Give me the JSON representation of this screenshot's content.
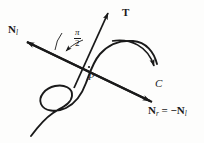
{
  "figure": {
    "kind": "math-diagram",
    "caption_absent": true,
    "background_color": "#fdfdfc",
    "ink_color": "#1a1a1a"
  },
  "labels": {
    "normal_left": {
      "symbol": "N",
      "subscript": "l"
    },
    "tangent": {
      "symbol": "T"
    },
    "curve": {
      "symbol": "C"
    },
    "point": {
      "symbol": "P"
    },
    "angle": {
      "numerator": "π",
      "denominator": "2"
    },
    "equation": {
      "lhs_symbol": "N",
      "lhs_subscript": "r",
      "relation": " = −",
      "rhs_symbol": "N",
      "rhs_subscript": "l"
    }
  },
  "geometry": {
    "normal_axis": {
      "start_x": 25,
      "start_y": 41,
      "end_x": 152,
      "end_y": 102,
      "arrow_both_ends": true
    },
    "tangent_ray": {
      "start_x": 75,
      "start_y": 86,
      "end_x": 109,
      "end_y": 11,
      "arrow_end": true
    },
    "point_P": {
      "x": 89,
      "y": 67
    },
    "angle_arc": {
      "center_x": 89,
      "center_y": 67,
      "radius": 34,
      "value_label": "π/2"
    },
    "orientation_arrow": {
      "start_x": 112,
      "start_y": 44,
      "end_x": 155,
      "end_y": 73
    }
  }
}
